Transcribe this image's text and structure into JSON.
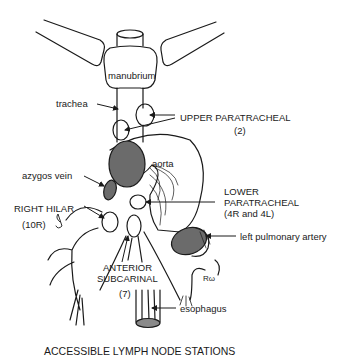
{
  "diagram": {
    "caption": "ACCESSIBLE LYMPH NODE STATIONS",
    "colors": {
      "line": "#1a1a1a",
      "dark_fill": "#6b6b6b",
      "esophagus_fill": "#8a8a8a",
      "background": "#ffffff"
    },
    "labels": {
      "manubrium": "manubrium",
      "trachea": "trachea",
      "upper_paratracheal": "UPPER PARATRACHEAL",
      "upper_paratracheal_station": "(2)",
      "aorta": "aorta",
      "azygos_vein": "azygos vein",
      "lower_paratracheal_1": "LOWER",
      "lower_paratracheal_2": "PARATRACHEAL",
      "lower_paratracheal_station": "(4R and 4L)",
      "right_hilar": "RIGHT HILAR",
      "right_hilar_station": "(10R)",
      "left_pulmonary_artery": "left pulmonary artery",
      "anterior_subcarinal_1": "ANTERIOR",
      "anterior_subcarinal_2": "SUBCARINAL",
      "anterior_subcarinal_station": "(7)",
      "esophagus": "esophagus",
      "lw_mark": "Rω"
    }
  }
}
